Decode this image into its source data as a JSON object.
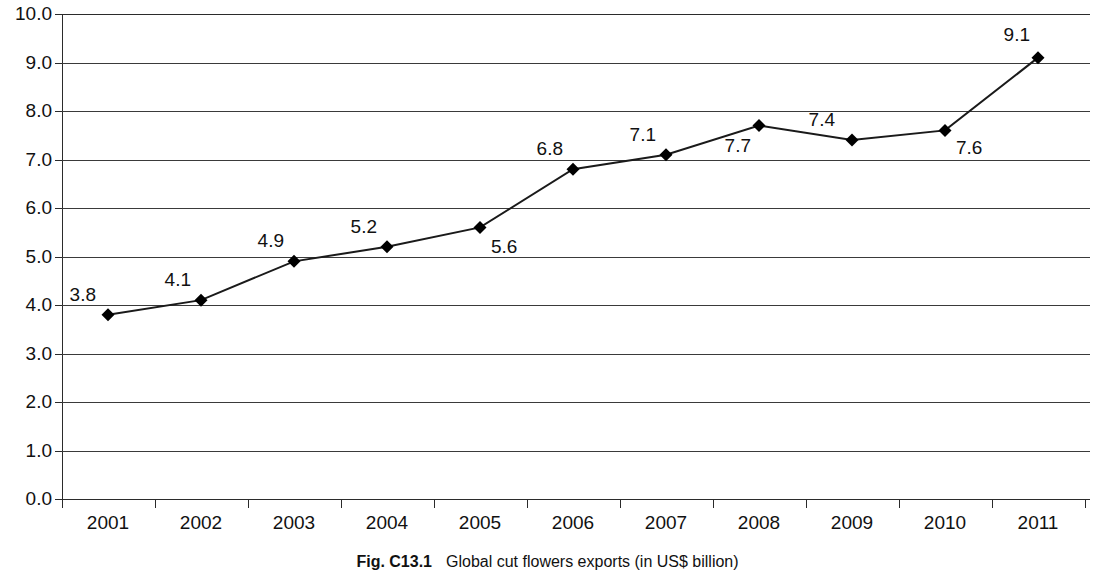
{
  "caption": {
    "number": "Fig. C13.1",
    "text": "Global cut flowers exports (in US$ billion)"
  },
  "chart_data": {
    "type": "line",
    "title": "Global cut flowers exports (in US$ billion)",
    "xlabel": "",
    "ylabel": "",
    "categories": [
      "2001",
      "2002",
      "2003",
      "2004",
      "2005",
      "2006",
      "2007",
      "2008",
      "2009",
      "2010",
      "2011"
    ],
    "values": [
      3.8,
      4.1,
      4.9,
      5.2,
      5.6,
      6.8,
      7.1,
      7.7,
      7.4,
      7.6,
      9.1
    ],
    "data_labels": [
      "3.8",
      "4.1",
      "4.9",
      "5.2",
      "5.6",
      "6.8",
      "7.1",
      "7.7",
      "7.4",
      "7.6",
      "9.1"
    ],
    "ylim": [
      0.0,
      10.0
    ],
    "ytick_labels": [
      "10.0",
      "9.0",
      "8.0",
      "7.0",
      "6.0",
      "5.0",
      "4.0",
      "3.0",
      "2.0",
      "1.0",
      "0.0"
    ],
    "ytick_values": [
      10.0,
      9.0,
      8.0,
      7.0,
      6.0,
      5.0,
      4.0,
      3.0,
      2.0,
      1.0,
      0.0
    ],
    "grid": true,
    "legend": false,
    "marker": "diamond",
    "marker_color": "#000000",
    "line_color": "#1a1a1a",
    "background_color": "#ffffff",
    "grid_color": "#3a3a3a"
  }
}
